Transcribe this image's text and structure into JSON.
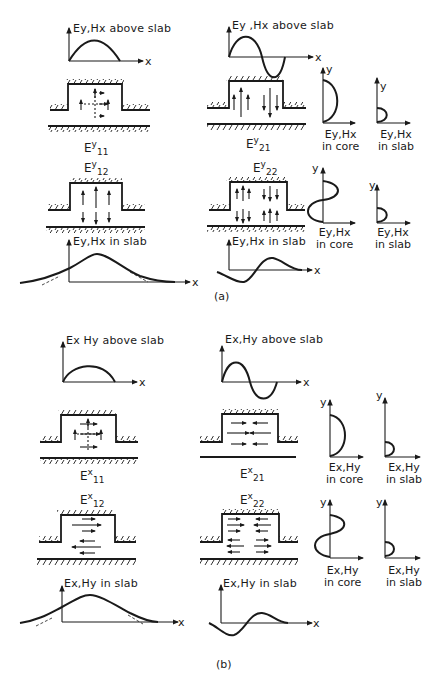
{
  "figure": {
    "part_a": {
      "caption": "(a)",
      "left": {
        "above_slab_label": "Ey,Hx above slab",
        "x_axis": "x",
        "mode_top": {
          "base": "E",
          "sup": "y",
          "sub": "11"
        },
        "mode_bottom": {
          "base": "E",
          "sup": "y",
          "sub": "12"
        },
        "in_slab_label": "Ey,Hx in slab"
      },
      "right": {
        "above_slab_label": "Ey ,Hx above slab",
        "x_axis": "x",
        "mode_top": {
          "base": "E",
          "sup": "y",
          "sub": "21"
        },
        "mode_bottom": {
          "base": "E",
          "sup": "y",
          "sub": "22"
        },
        "in_slab_label": "Ey,Hx in slab"
      },
      "profiles": {
        "y_axis": "y",
        "core_top": [
          "Ey,Hx",
          "in core"
        ],
        "slab_top": [
          "Ey,Hx",
          "in slab"
        ],
        "core_bottom": [
          "Ey,Hx",
          "in core"
        ],
        "slab_bottom": [
          "Ey,Hx",
          "in slab"
        ]
      }
    },
    "part_b": {
      "caption": "(b)",
      "left": {
        "above_slab_label": "Ex Hy above slab",
        "x_axis": "x",
        "mode_top": {
          "base": "E",
          "sup": "x",
          "sub": "11"
        },
        "mode_bottom": {
          "base": "E",
          "sup": "x",
          "sub": "12"
        },
        "in_slab_label": "Ex,Hy in slab"
      },
      "right": {
        "above_slab_label": "Ex,Hy above slab",
        "x_axis": "x",
        "mode_top": {
          "base": "E",
          "sup": "x",
          "sub": "21"
        },
        "mode_bottom": {
          "base": "E",
          "sup": "x",
          "sub": "22"
        },
        "in_slab_label": "Ex,Hy in slab"
      },
      "profiles": {
        "y_axis": "y",
        "core_top": [
          "Ex,Hy",
          "in core"
        ],
        "slab_top": [
          "Ex,Hy",
          "in slab"
        ],
        "core_bottom": [
          "Ex,Hy",
          "in core"
        ],
        "slab_bottom": [
          "Ex,Hy",
          "in slab"
        ]
      }
    }
  }
}
